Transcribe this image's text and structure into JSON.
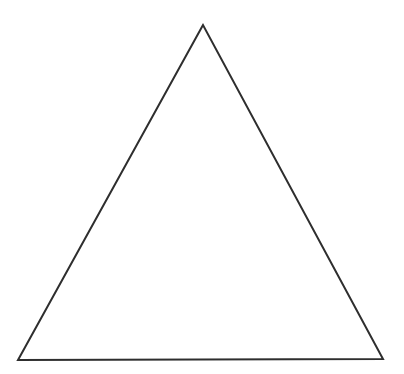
{
  "canvas": {
    "width": 404,
    "height": 374,
    "background_color": "#ffffff"
  },
  "shape": {
    "name": "triangle-outline",
    "type": "polygon",
    "points_attr": "203,25 18,360 383,359",
    "vertices": [
      {
        "x": 203,
        "y": 25
      },
      {
        "x": 18,
        "y": 360
      },
      {
        "x": 383,
        "y": 359
      }
    ],
    "stroke_color": "#2e2e2e",
    "stroke_width": 2,
    "fill": "none"
  }
}
